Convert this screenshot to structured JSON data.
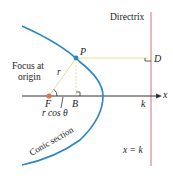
{
  "labels": {
    "directrix": "Directrix",
    "point_p": "P",
    "point_d": "D",
    "focus_line1": "Focus at",
    "focus_line2": "origin",
    "r": "r",
    "focus_f": "F",
    "point_b": "B",
    "rcos": "r cos θ",
    "k_axis": "k",
    "x_axis": "x",
    "conic": "Conic section",
    "x_eq_k": "x = k"
  },
  "colors": {
    "curve": "#2b86c8",
    "directrix": "#c9747a",
    "guide": "#e6df9a",
    "focus": "#d9764a",
    "axis": "#333333"
  }
}
